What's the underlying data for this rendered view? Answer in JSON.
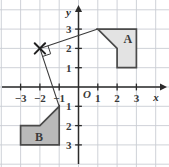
{
  "figure": {
    "name": "coordinate-plane-rotation-diagram",
    "background_color": "#ffffff",
    "grid_color": "#c9cdd4",
    "axis_color": "#2b2b2b"
  },
  "axes": {
    "x_axis_label": "x",
    "y_axis_label": "y",
    "origin_label": "O",
    "x_ticks": [
      {
        "value": -3,
        "label": "−3"
      },
      {
        "value": -2,
        "label": "−2"
      },
      {
        "value": -1,
        "label": "−1"
      },
      {
        "value": 1,
        "label": "1"
      },
      {
        "value": 2,
        "label": "2"
      },
      {
        "value": 3,
        "label": "3"
      }
    ],
    "y_ticks": [
      {
        "value": 3,
        "label": "3"
      },
      {
        "value": 2,
        "label": "2"
      },
      {
        "value": 1,
        "label": "1"
      },
      {
        "value": -1,
        "label": "1"
      },
      {
        "value": -2,
        "label": "2"
      },
      {
        "value": -3,
        "label": "3"
      }
    ],
    "x_range": [
      -4,
      4
    ],
    "y_range": [
      -4,
      4
    ]
  },
  "shapes": [
    {
      "label": "A",
      "fill_color": "#e3e3e3",
      "stroke_color": "#4a4a4a",
      "label_point": [
        2.55,
        2.5
      ],
      "vertices": [
        [
          1,
          3
        ],
        [
          3,
          3
        ],
        [
          3,
          1
        ],
        [
          2,
          1
        ],
        [
          2,
          2
        ]
      ]
    },
    {
      "label": "B",
      "fill_color": "#b9b9b9",
      "stroke_color": "#4a4a4a",
      "label_point": [
        -2.05,
        -2.6
      ],
      "vertices": [
        [
          -1,
          -1
        ],
        [
          -1,
          -3
        ],
        [
          -3,
          -3
        ],
        [
          -3,
          -2
        ],
        [
          -2,
          -2
        ]
      ]
    }
  ],
  "center_of_rotation": {
    "label": "X",
    "point": [
      -2,
      2
    ],
    "marker": "x-cross"
  },
  "rays": [
    {
      "name": "ray-to-shape-a",
      "from": [
        -2,
        2
      ],
      "to": [
        1,
        3
      ]
    },
    {
      "name": "ray-to-shape-b",
      "from": [
        -2,
        2
      ],
      "to": [
        -1,
        -1
      ]
    }
  ],
  "right_angle_marker": {
    "name": "right-angle-mark",
    "at": [
      -2,
      2
    ]
  }
}
